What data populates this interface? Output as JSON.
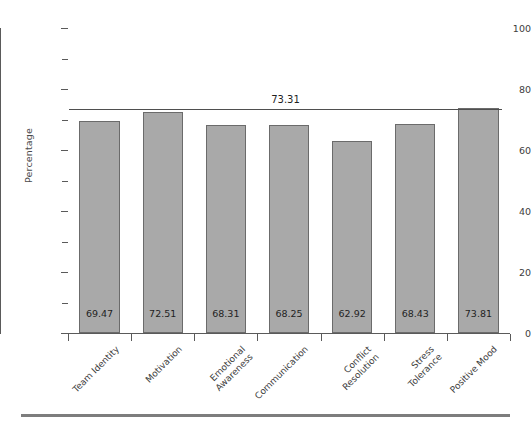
{
  "chart_data": {
    "type": "bar",
    "title": "",
    "subtitle": "",
    "xlabel": "",
    "ylabel": "Percentage",
    "ylim": [
      0,
      100
    ],
    "grid": false,
    "legend": null,
    "orientation": "vertical",
    "bar_color": "#a9a9a9",
    "bar_edge_color": "#6b6b6b",
    "axis_color": "#5a5a5a",
    "categories": [
      "Team Identity",
      "Motivation",
      "Emotional\nAwareness",
      "Communication",
      "Conflict\nResolution",
      "Stress\nTolerance",
      "Positive Mood"
    ],
    "values": [
      69.47,
      72.51,
      68.31,
      68.25,
      62.92,
      68.43,
      73.81
    ],
    "value_labels": [
      "69.47",
      "72.51",
      "68.31",
      "68.25",
      "62.92",
      "68.43",
      "73.81"
    ],
    "y_major_ticks": [
      0,
      20,
      40,
      60,
      80,
      100
    ],
    "y_major_tick_labels": [
      "0",
      "20",
      "40",
      "60",
      "80",
      "100"
    ],
    "y_minor_ticks": [
      10,
      30,
      50,
      70,
      90
    ],
    "reference_line": {
      "value": 73.31,
      "label": "73.31",
      "color": "#4f4f4f",
      "style": "solid"
    }
  }
}
